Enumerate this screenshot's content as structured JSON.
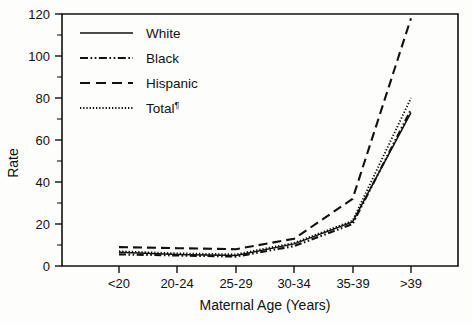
{
  "chart_data": {
    "type": "line",
    "title": "",
    "xlabel": "Maternal Age (Years)",
    "ylabel": "Rate",
    "categories": [
      "<20",
      "20-24",
      "25-29",
      "30-34",
      "35-39",
      ">39"
    ],
    "ylim": [
      0,
      120
    ],
    "yticks": [
      0,
      20,
      40,
      60,
      80,
      100,
      120
    ],
    "yticklabels": [
      "0",
      "20",
      "40",
      "60",
      "80",
      "100",
      "120"
    ],
    "grid": false,
    "legend_position": "upper left",
    "series": [
      {
        "name": "White",
        "style": "solid",
        "values": [
          6.5,
          5.5,
          5.0,
          10.5,
          21.0,
          73.0
        ]
      },
      {
        "name": "Black",
        "style": "dash-dot-dot",
        "values": [
          5.5,
          5.0,
          4.5,
          9.5,
          20.0,
          74.5
        ]
      },
      {
        "name": "Hispanic",
        "style": "dashed",
        "values": [
          9.0,
          8.5,
          8.0,
          13.0,
          32.0,
          118.0
        ]
      },
      {
        "name": "Total",
        "style": "dotted",
        "values": [
          7.0,
          6.0,
          5.5,
          11.0,
          21.5,
          80.0
        ]
      }
    ]
  },
  "legend": {
    "entries": [
      {
        "label": "White",
        "suffix": ""
      },
      {
        "label": "Black",
        "suffix": ""
      },
      {
        "label": "Hispanic",
        "suffix": ""
      },
      {
        "label": "Total",
        "suffix": "¶"
      }
    ]
  },
  "axes": {
    "x_title": "Maternal Age (Years)",
    "y_title": "Rate",
    "x_labels": [
      "<20",
      "20-24",
      "25-29",
      "30-34",
      "35-39",
      ">39"
    ],
    "y_labels": [
      "120",
      "100",
      "80",
      "60",
      "40",
      "20",
      "0"
    ]
  }
}
